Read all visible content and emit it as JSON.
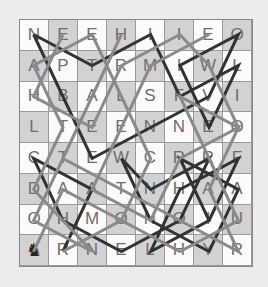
{
  "puzzle": {
    "type": "knight-tour-word-search",
    "rows": 8,
    "cols": 8,
    "grid": [
      [
        "N",
        "E",
        "E",
        "H",
        "I",
        "I",
        "E",
        "O"
      ],
      [
        "A",
        "P",
        "T",
        "R",
        "M",
        "I",
        "W",
        "L"
      ],
      [
        "H",
        "B",
        "A",
        "L",
        "S",
        "F",
        "V",
        "I"
      ],
      [
        "L",
        "T",
        "E",
        "E",
        "N",
        "N",
        "E",
        "O"
      ],
      [
        "C",
        "T",
        "E",
        "W",
        "C",
        "R",
        "R",
        "F"
      ],
      [
        "D",
        "A",
        "A",
        "T",
        "N",
        "H",
        "A",
        "A"
      ],
      [
        "O",
        "H",
        "M",
        "O",
        "N",
        "O",
        "I",
        "U"
      ],
      [
        "knight",
        "R",
        "N",
        "E",
        "L",
        "H",
        "Y",
        "R"
      ]
    ],
    "start_piece": {
      "symbol": "♞",
      "name": "knight",
      "row": 7,
      "col": 0
    },
    "colors": {
      "background": "#ececec",
      "light_cell": "#fbfbfb",
      "dark_cell": "#d2d2d2",
      "letter": "#6e6e6e",
      "path_dark": "#333333",
      "path_gray": "#8a8a8a"
    },
    "paths": [
      {
        "style": "dark",
        "cells": [
          [
            0,
            0
          ],
          [
            1,
            2
          ],
          [
            0,
            4
          ],
          [
            2,
            5
          ],
          [
            1,
            7
          ],
          [
            3,
            6
          ],
          [
            1,
            5
          ],
          [
            0,
            7
          ],
          [
            2,
            6
          ],
          [
            3,
            4
          ],
          [
            4,
            2
          ],
          [
            2,
            1
          ],
          [
            0,
            0
          ]
        ]
      },
      {
        "style": "dark",
        "cells": [
          [
            7,
            1
          ],
          [
            5,
            2
          ],
          [
            4,
            0
          ],
          [
            6,
            1
          ],
          [
            7,
            3
          ],
          [
            6,
            5
          ],
          [
            4,
            6
          ],
          [
            5,
            4
          ],
          [
            4,
            3
          ],
          [
            6,
            4
          ],
          [
            7,
            6
          ],
          [
            5,
            7
          ],
          [
            4,
            5
          ],
          [
            6,
            6
          ],
          [
            7,
            4
          ],
          [
            5,
            5
          ],
          [
            4,
            7
          ],
          [
            6,
            6
          ]
        ]
      },
      {
        "style": "gray",
        "cells": [
          [
            0,
            1
          ],
          [
            2,
            0
          ],
          [
            3,
            2
          ],
          [
            1,
            3
          ],
          [
            0,
            5
          ],
          [
            1,
            6
          ],
          [
            3,
            7
          ],
          [
            2,
            5
          ],
          [
            4,
            6
          ],
          [
            6,
            7
          ],
          [
            7,
            5
          ],
          [
            6,
            3
          ],
          [
            7,
            1
          ]
        ]
      },
      {
        "style": "gray",
        "cells": [
          [
            7,
            0
          ],
          [
            5,
            1
          ],
          [
            6,
            3
          ],
          [
            4,
            4
          ],
          [
            2,
            3
          ],
          [
            0,
            2
          ],
          [
            1,
            0
          ],
          [
            3,
            1
          ],
          [
            5,
            0
          ],
          [
            7,
            2
          ],
          [
            6,
            0
          ],
          [
            4,
            1
          ],
          [
            2,
            2
          ],
          [
            0,
            3
          ]
        ]
      },
      {
        "style": "gray",
        "cells": [
          [
            0,
            6
          ],
          [
            1,
            4
          ],
          [
            3,
            3
          ],
          [
            5,
            2
          ],
          [
            6,
            4
          ],
          [
            4,
            5
          ],
          [
            3,
            7
          ],
          [
            5,
            6
          ],
          [
            7,
            7
          ],
          [
            6,
            5
          ],
          [
            5,
            3
          ],
          [
            4,
            1
          ]
        ]
      }
    ]
  }
}
